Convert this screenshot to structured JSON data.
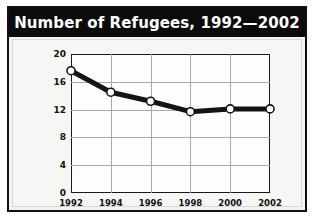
{
  "chart_title": "Number of Refugees, 1992—2002",
  "title_bar": {
    "background": "#0b0b0b",
    "text_color": "#ffffff"
  },
  "axis": {
    "ylabel": "Numbers in Millions",
    "xlabel": "",
    "y_ticks": [
      "0",
      "4",
      "8",
      "12",
      "16",
      "20"
    ],
    "x_ticks": [
      "1992",
      "1994",
      "1996",
      "1998",
      "2000",
      "2002"
    ]
  },
  "colors": {
    "line": "#141414",
    "marker_fill": "#ffffff",
    "marker_stroke": "#141414",
    "grid": "#a9a9a6",
    "frame": "#1a1a1a",
    "panel_background": "#f6f6f4",
    "figure_border": "#111111"
  },
  "chart_data": {
    "type": "line",
    "title": "Number of Refugees, 1992—2002",
    "xlabel": "",
    "ylabel": "Numbers in Millions",
    "categories": [
      "1992",
      "1994",
      "1996",
      "1998",
      "2000",
      "2002"
    ],
    "x": [
      1992,
      1994,
      1996,
      1998,
      2000,
      2002
    ],
    "values": [
      17.6,
      14.5,
      13.2,
      11.7,
      12.1,
      12.1
    ],
    "series": [
      {
        "name": "Number of Refugees",
        "values": [
          17.6,
          14.5,
          13.2,
          11.7,
          12.1,
          12.1
        ]
      }
    ],
    "ylim": [
      0,
      20
    ],
    "yticks": [
      0,
      4,
      8,
      12,
      16,
      20
    ],
    "xlim": [
      1992,
      2002
    ],
    "xticks": [
      1992,
      1994,
      1996,
      1998,
      2000,
      2002
    ],
    "grid": true,
    "legend": false,
    "marker": "circle-open",
    "line_width": 5
  }
}
